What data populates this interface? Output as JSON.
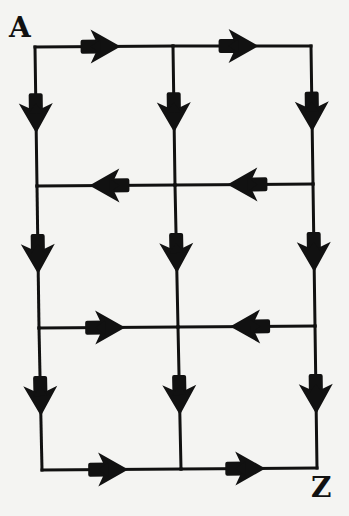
{
  "diagram": {
    "type": "directed grid path diagram",
    "start_label": "A",
    "end_label": "Z",
    "line_color": "#111111",
    "background_color": "#f4f4f2",
    "nodes": {
      "r0c0": [
        35,
        47
      ],
      "r0c1": [
        173,
        46
      ],
      "r0c2": [
        311,
        46
      ],
      "r1c0": [
        37,
        186
      ],
      "r1c1": [
        175,
        185
      ],
      "r1c2": [
        313,
        184
      ],
      "r2c0": [
        39,
        328
      ],
      "r2c1": [
        178,
        327
      ],
      "r2c2": [
        315,
        326
      ],
      "r3c0": [
        42,
        470
      ],
      "r3c1": [
        181,
        469
      ],
      "r3c2": [
        317,
        468
      ]
    },
    "edges": [
      {
        "from": "r0c0",
        "to": "r0c1",
        "direction": "right"
      },
      {
        "from": "r0c1",
        "to": "r0c2",
        "direction": "right"
      },
      {
        "from": "r1c2",
        "to": "r1c1",
        "direction": "left"
      },
      {
        "from": "r1c1",
        "to": "r1c0",
        "direction": "left"
      },
      {
        "from": "r2c0",
        "to": "r2c1",
        "direction": "right"
      },
      {
        "from": "r2c2",
        "to": "r2c1",
        "direction": "left"
      },
      {
        "from": "r3c0",
        "to": "r3c1",
        "direction": "right"
      },
      {
        "from": "r3c1",
        "to": "r3c2",
        "direction": "right"
      },
      {
        "from": "r0c0",
        "to": "r1c0",
        "direction": "down"
      },
      {
        "from": "r1c0",
        "to": "r2c0",
        "direction": "down"
      },
      {
        "from": "r2c0",
        "to": "r3c0",
        "direction": "down"
      },
      {
        "from": "r0c1",
        "to": "r1c1",
        "direction": "down"
      },
      {
        "from": "r1c1",
        "to": "r2c1",
        "direction": "down"
      },
      {
        "from": "r2c1",
        "to": "r3c1",
        "direction": "down"
      },
      {
        "from": "r0c2",
        "to": "r1c2",
        "direction": "down"
      },
      {
        "from": "r1c2",
        "to": "r2c2",
        "direction": "down"
      },
      {
        "from": "r2c2",
        "to": "r3c2",
        "direction": "down"
      }
    ]
  }
}
